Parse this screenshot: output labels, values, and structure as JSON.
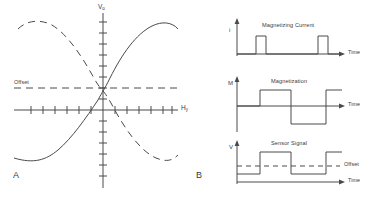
{
  "figure": {
    "panel_a": {
      "letter": "A",
      "y_axis_label": "V",
      "y_axis_sub": "o",
      "x_axis_label": "H",
      "x_axis_sub": "y",
      "offset_label": "Offset",
      "description": "Sensor transfer characteristic: output voltage versus applied field, two mirrored S-shaped curves (solid and dashed) about the offset level",
      "curves": [
        {
          "name": "solid-transfer-curve",
          "style": "solid"
        },
        {
          "name": "dashed-transfer-curve",
          "style": "dashed"
        }
      ],
      "x_tick_count": 12,
      "y_tick_count": 14
    },
    "panel_b": {
      "letter": "B",
      "time_axis_label": "Time",
      "offset_label": "Offset",
      "plots": [
        {
          "name": "magnetizing-current-plot",
          "title": "Magnetizing Current",
          "y_axis_label": "i",
          "waveform": "narrow-positive-pulses",
          "pulses": [
            {
              "start": 0.18,
              "end": 0.27,
              "level": 1
            },
            {
              "start": 0.82,
              "end": 0.91,
              "level": 1
            }
          ]
        },
        {
          "name": "magnetization-plot",
          "title": "Magnetization",
          "y_axis_label": "M",
          "waveform": "bipolar-square-wave",
          "levels": [
            {
              "start": 0.0,
              "end": 0.22,
              "level": 0
            },
            {
              "start": 0.22,
              "end": 0.52,
              "level": 1
            },
            {
              "start": 0.52,
              "end": 0.86,
              "level": -1
            },
            {
              "start": 0.86,
              "end": 1.0,
              "level": 1
            }
          ]
        },
        {
          "name": "sensor-signal-plot",
          "title": "Sensor Signal",
          "y_axis_label": "V",
          "waveform": "unipolar-square-wave-about-offset",
          "offset_level": 0.5,
          "levels": [
            {
              "start": 0.0,
              "end": 0.22,
              "level": 0.15
            },
            {
              "start": 0.22,
              "end": 0.52,
              "level": 0.92
            },
            {
              "start": 0.52,
              "end": 0.86,
              "level": 0.15
            },
            {
              "start": 0.86,
              "end": 1.0,
              "level": 0.92
            }
          ]
        }
      ]
    }
  },
  "colors": {
    "stroke": "#4a4a4a",
    "text": "#3a3a3a",
    "background": "#ffffff"
  }
}
